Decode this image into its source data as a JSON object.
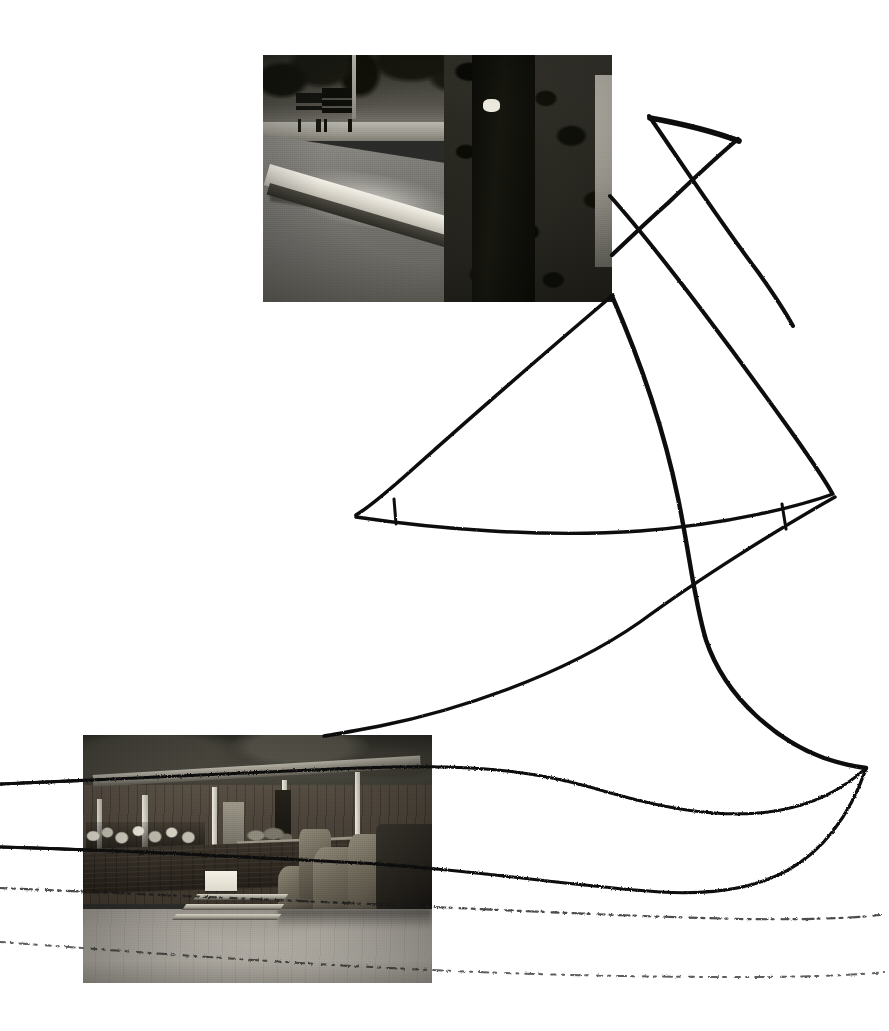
{
  "artwork": {
    "title": "Untitled photo-collage with hand-drawn ink lines",
    "medium": "black-and-white photographs mounted on white paper with pen drawing",
    "canvas": {
      "width": 889,
      "height": 1031,
      "background_color": "#ffffff"
    },
    "ink_color": "#0a0a0a"
  },
  "photographs": [
    {
      "id": "photo-roadside",
      "caption": "Roadside view with two park benches, curb, tree trunk and foliage",
      "position": {
        "x": 263,
        "y": 55,
        "width": 349,
        "height": 247
      },
      "tone": "black-and-white",
      "elements": [
        "park bench (left)",
        "park bench (right)",
        "utility pole",
        "asphalt road",
        "concrete curb",
        "tree trunk",
        "leafy shrub",
        "bright sky / treeline"
      ]
    },
    {
      "id": "photo-pavilion",
      "caption": "Open-air pavilion against a rock cliff with seated crowd, low wall, steps and boulders",
      "position": {
        "x": 83,
        "y": 735,
        "width": 349,
        "height": 248
      },
      "tone": "black-and-white",
      "elements": [
        "rock cliff face",
        "canopy roof with vertical posts",
        "crowd of figures",
        "low stone wall",
        "white podium block",
        "three broad steps",
        "carved stone boulders",
        "open gravel plaza"
      ]
    }
  ],
  "ink_drawing": {
    "description": "Sketched sailboat-like rigging: crossed spars at upper right, a long swept mast curve, a low boom, and four near-horizontal lines running off the left and right edges",
    "strokes": [
      {
        "name": "spar-upper-left-down-right",
        "from": [
          650,
          117
        ],
        "to": [
          793,
          326
        ],
        "style": "solid"
      },
      {
        "name": "spar-upper-right-down-left",
        "from": [
          737,
          140
        ],
        "to": [
          612,
          196
        ],
        "style": "solid"
      },
      {
        "name": "crossbar-apex",
        "from": [
          650,
          118
        ],
        "to": [
          738,
          142
        ],
        "style": "solid"
      },
      {
        "name": "mast-long-curve",
        "from": [
          612,
          297
        ],
        "to": [
          866,
          768
        ],
        "style": "curved"
      },
      {
        "name": "sail-leech-diagonal",
        "from": [
          612,
          296
        ],
        "to": [
          356,
          515
        ],
        "style": "curved"
      },
      {
        "name": "boom-lower",
        "from": [
          356,
          517
        ],
        "to": [
          832,
          494
        ],
        "style": "curved"
      },
      {
        "name": "tack-tick-left",
        "from": [
          394,
          500
        ],
        "to": [
          396,
          523
        ],
        "style": "solid"
      },
      {
        "name": "clew-tick-right",
        "from": [
          783,
          505
        ],
        "to": [
          786,
          528
        ],
        "style": "solid"
      },
      {
        "name": "stay-left-to-right",
        "from": [
          612,
          196
        ],
        "to": [
          831,
          493
        ],
        "style": "solid"
      },
      {
        "name": "long-sweep-to-pavilion",
        "from": [
          836,
          497
        ],
        "to": [
          324,
          736
        ],
        "style": "curved"
      },
      {
        "name": "shore-line-upper",
        "from": [
          0,
          783
        ],
        "to": [
          866,
          768
        ],
        "style": "curved"
      },
      {
        "name": "shore-line-second",
        "from": [
          0,
          846
        ],
        "to": [
          866,
          768
        ],
        "style": "curved"
      },
      {
        "name": "shore-line-third",
        "from": [
          0,
          888
        ],
        "to": [
          880,
          915
        ],
        "style": "dashed-faint"
      },
      {
        "name": "shore-line-bottom",
        "from": [
          0,
          942
        ],
        "to": [
          884,
          973
        ],
        "style": "dashed-faint"
      }
    ],
    "stroke_count": 14,
    "crossing_points": [
      [
        707,
        187
      ],
      [
        670,
        237
      ],
      [
        616,
        293
      ],
      [
        675,
        500
      ],
      [
        695,
        571
      ],
      [
        866,
        768
      ]
    ]
  }
}
